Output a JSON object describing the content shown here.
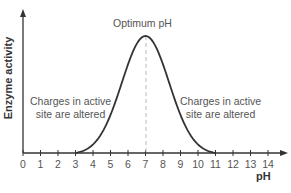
{
  "chart_data": {
    "type": "line",
    "title": "",
    "xlabel": "pH",
    "ylabel": "Enzyme activity",
    "xlim": [
      0,
      14
    ],
    "x_ticks": [
      0,
      1,
      2,
      3,
      4,
      5,
      6,
      7,
      8,
      9,
      10,
      11,
      12,
      13,
      14
    ],
    "y_ticks": [],
    "grid": false,
    "x": [
      3,
      4,
      5,
      6,
      7,
      8,
      9,
      10,
      11
    ],
    "series": [
      {
        "name": "Enzyme activity",
        "values": [
          0,
          11,
          45,
          84,
          100,
          84,
          45,
          11,
          0
        ]
      }
    ],
    "annotations": [
      {
        "text": "Optimum pH",
        "x": 7,
        "note": "dashed vertical line at pH 7"
      },
      {
        "text": "Charges in active site are altered",
        "position": "left of curve"
      },
      {
        "text": "Charges in active site are altered",
        "position": "right of curve"
      }
    ]
  },
  "labels": {
    "ylabel": "Enzyme activity",
    "xlabel": "pH",
    "optimum": "Optimum pH",
    "left_line1": "Charges in active",
    "left_line2": "site are altered",
    "right_line1": "Charges in active",
    "right_line2": "site are altered",
    "ticks": [
      "0",
      "1",
      "2",
      "3",
      "4",
      "5",
      "6",
      "7",
      "8",
      "9",
      "10",
      "11",
      "12",
      "13",
      "14"
    ]
  }
}
